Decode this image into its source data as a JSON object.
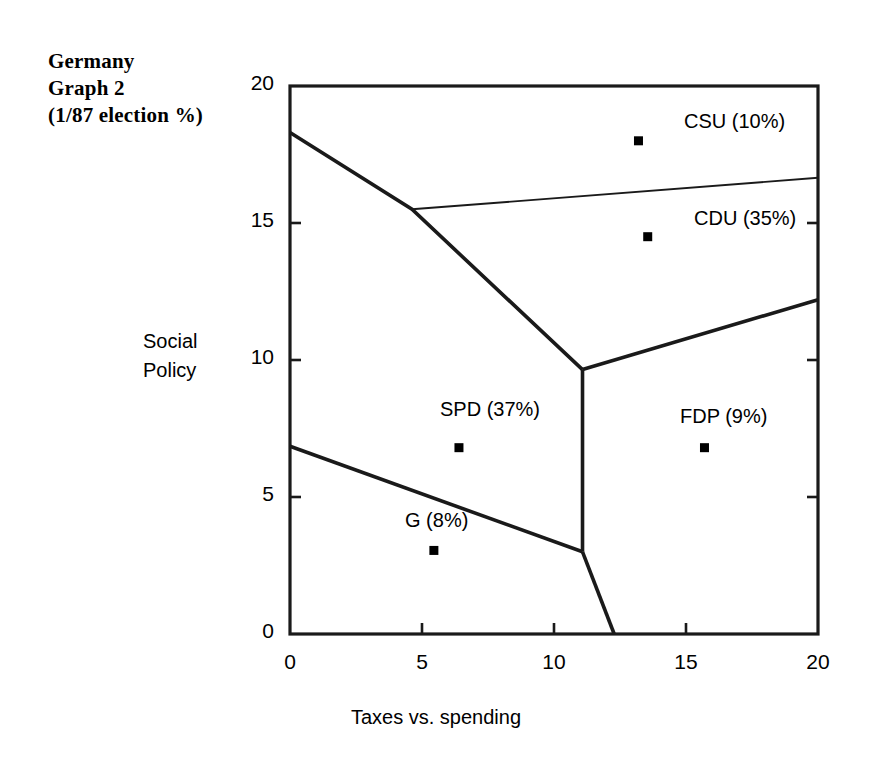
{
  "chart_data": {
    "type": "scatter",
    "title": "Germany Graph 2 (1/87 election %)",
    "title_lines": [
      "Germany",
      "Graph 2",
      "(1/87 election %)"
    ],
    "xlabel": "Taxes vs. spending",
    "ylabel": "Social Policy",
    "ylabel_lines": [
      "Social",
      "Policy"
    ],
    "xlim": [
      0,
      20
    ],
    "ylim": [
      0,
      20
    ],
    "xticks": [
      "0",
      "5",
      "10",
      "15",
      "20"
    ],
    "yticks": [
      "0",
      "5",
      "10",
      "15",
      "20"
    ],
    "xtick_values": [
      0,
      5,
      10,
      15,
      20
    ],
    "ytick_values": [
      0,
      5,
      10,
      15,
      20
    ],
    "grid": false,
    "legend": "none",
    "tick_direction": "in",
    "points": [
      {
        "name": "CSU",
        "label": "CSU (10%)",
        "x": 13.2,
        "y": 18.0,
        "share_pct": 10,
        "label_pos": "right"
      },
      {
        "name": "CDU",
        "label": "CDU (35%)",
        "x": 13.55,
        "y": 14.5,
        "share_pct": 35,
        "label_pos": "right"
      },
      {
        "name": "SPD",
        "label": "SPD (37%)",
        "x": 6.4,
        "y": 6.8,
        "share_pct": 37,
        "label_pos": "above"
      },
      {
        "name": "FDP",
        "label": "FDP (9%)",
        "x": 15.7,
        "y": 6.8,
        "share_pct": 9,
        "label_pos": "above"
      },
      {
        "name": "G",
        "label": "G (8%)",
        "x": 5.45,
        "y": 3.05,
        "share_pct": 8,
        "label_pos": "above"
      }
    ],
    "boundaries": [
      {
        "name": "upper-left-boundary",
        "weight": "thick",
        "path": [
          [
            0,
            18.3
          ],
          [
            4.62,
            15.5
          ],
          [
            11.08,
            9.65
          ]
        ]
      },
      {
        "name": "upper-right-boundary",
        "weight": "thin",
        "path": [
          [
            4.62,
            15.5
          ],
          [
            20,
            16.65
          ]
        ]
      },
      {
        "name": "right-boundary",
        "weight": "thick",
        "path": [
          [
            11.08,
            9.65
          ],
          [
            20,
            12.2
          ]
        ]
      },
      {
        "name": "center-vertical-boundary",
        "weight": "thick",
        "path": [
          [
            11.08,
            9.65
          ],
          [
            11.08,
            3.0
          ]
        ]
      },
      {
        "name": "lower-left-boundary",
        "weight": "thick",
        "path": [
          [
            0,
            6.85
          ],
          [
            11.08,
            3.0
          ]
        ]
      },
      {
        "name": "lower-right-boundary",
        "weight": "thick",
        "path": [
          [
            11.08,
            3.0
          ],
          [
            12.28,
            0
          ]
        ]
      }
    ],
    "marker": {
      "shape": "square",
      "color": "#000000",
      "size_px": 9
    },
    "line_color": "#1a1a1a",
    "axis_color": "#1a1a1a"
  }
}
